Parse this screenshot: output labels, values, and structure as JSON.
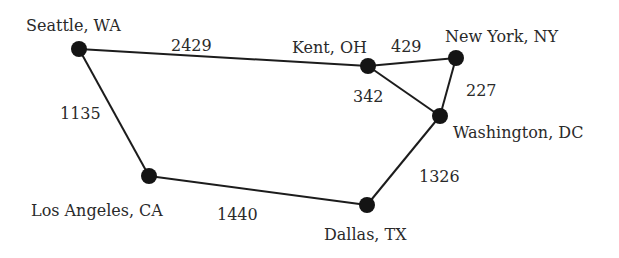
{
  "graph": {
    "nodes": [
      {
        "id": "seattle",
        "label": "Seattle, WA",
        "x": 79,
        "y": 49,
        "lx": 26,
        "ly": 31
      },
      {
        "id": "kent",
        "label": "Kent, OH",
        "x": 368,
        "y": 66,
        "lx": 292,
        "ly": 53
      },
      {
        "id": "newyork",
        "label": "New York, NY",
        "x": 456,
        "y": 58,
        "lx": 445,
        "ly": 42
      },
      {
        "id": "washington",
        "label": "Washington, DC",
        "x": 440,
        "y": 116,
        "lx": 453,
        "ly": 138
      },
      {
        "id": "losangeles",
        "label": "Los Angeles, CA",
        "x": 149,
        "y": 176,
        "lx": 31,
        "ly": 216
      },
      {
        "id": "dallas",
        "label": "Dallas, TX",
        "x": 367,
        "y": 205,
        "lx": 324,
        "ly": 240
      }
    ],
    "edges": [
      {
        "from": "seattle",
        "to": "kent",
        "weight": "2429",
        "wx": 171,
        "wy": 51
      },
      {
        "from": "kent",
        "to": "newyork",
        "weight": "429",
        "wx": 391,
        "wy": 52
      },
      {
        "from": "kent",
        "to": "washington",
        "weight": "342",
        "wx": 353,
        "wy": 102
      },
      {
        "from": "newyork",
        "to": "washington",
        "weight": "227",
        "wx": 466,
        "wy": 96
      },
      {
        "from": "seattle",
        "to": "losangeles",
        "weight": "1135",
        "wx": 60,
        "wy": 119
      },
      {
        "from": "losangeles",
        "to": "dallas",
        "weight": "1440",
        "wx": 217,
        "wy": 220
      },
      {
        "from": "washington",
        "to": "dallas",
        "weight": "1326",
        "wx": 419,
        "wy": 182
      }
    ]
  }
}
